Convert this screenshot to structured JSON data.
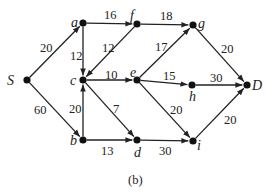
{
  "caption": "(b)",
  "nodes": [
    {
      "id": "S",
      "label": "S",
      "x": 27,
      "y": 80,
      "lx": 7,
      "ly": 85
    },
    {
      "id": "a",
      "label": "a",
      "x": 83,
      "y": 23,
      "lx": 71,
      "ly": 27
    },
    {
      "id": "f",
      "label": "f",
      "x": 137,
      "y": 24,
      "lx": 130,
      "ly": 20
    },
    {
      "id": "g",
      "label": "g",
      "x": 193,
      "y": 25,
      "lx": 198,
      "ly": 28
    },
    {
      "id": "c",
      "label": "c",
      "x": 83,
      "y": 80,
      "lx": 70,
      "ly": 85
    },
    {
      "id": "e",
      "label": "e",
      "x": 137,
      "y": 80,
      "lx": 130,
      "ly": 77
    },
    {
      "id": "h",
      "label": "h",
      "x": 192,
      "y": 85,
      "lx": 189,
      "ly": 101
    },
    {
      "id": "D",
      "label": "D",
      "x": 247,
      "y": 85,
      "lx": 252,
      "ly": 90
    },
    {
      "id": "b",
      "label": "b",
      "x": 83,
      "y": 140,
      "lx": 70,
      "ly": 145
    },
    {
      "id": "d",
      "label": "d",
      "x": 137,
      "y": 140,
      "lx": 134,
      "ly": 157
    },
    {
      "id": "i",
      "label": "i",
      "x": 193,
      "y": 141,
      "lx": 197,
      "ly": 150
    }
  ],
  "edges": [
    {
      "from": "S",
      "to": "a",
      "weight": "20",
      "wx": 40,
      "wy": 52
    },
    {
      "from": "S",
      "to": "b",
      "weight": "60",
      "wx": 34,
      "wy": 114
    },
    {
      "from": "a",
      "to": "f",
      "weight": "16",
      "wx": 104,
      "wy": 19
    },
    {
      "from": "a",
      "to": "c",
      "weight": "12",
      "wx": 70,
      "wy": 60
    },
    {
      "from": "f",
      "to": "c",
      "weight": "12",
      "wx": 102,
      "wy": 52
    },
    {
      "from": "f",
      "to": "g",
      "weight": "18",
      "wx": 160,
      "wy": 20
    },
    {
      "from": "c",
      "to": "e",
      "weight": "10",
      "wx": 105,
      "wy": 79
    },
    {
      "from": "b",
      "to": "c",
      "weight": "20",
      "wx": 69,
      "wy": 113
    },
    {
      "from": "c",
      "to": "d",
      "weight": "7",
      "wx": 113,
      "wy": 113
    },
    {
      "from": "b",
      "to": "d",
      "weight": "13",
      "wx": 101,
      "wy": 155
    },
    {
      "from": "e",
      "to": "g",
      "weight": "17",
      "wx": 155,
      "wy": 51
    },
    {
      "from": "e",
      "to": "h",
      "weight": "15",
      "wx": 163,
      "wy": 80
    },
    {
      "from": "e",
      "to": "i",
      "weight": "20",
      "wx": 170,
      "wy": 114
    },
    {
      "from": "g",
      "to": "D",
      "weight": "20",
      "wx": 221,
      "wy": 53
    },
    {
      "from": "h",
      "to": "D",
      "weight": "30",
      "wx": 210,
      "wy": 82
    },
    {
      "from": "d",
      "to": "i",
      "weight": "30",
      "wx": 159,
      "wy": 155
    },
    {
      "from": "i",
      "to": "D",
      "weight": "20",
      "wx": 224,
      "wy": 124
    }
  ]
}
